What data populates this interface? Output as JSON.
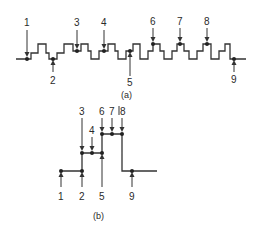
{
  "diagram_a": {
    "caption": "(a)",
    "points": [
      {
        "label": "1",
        "x": 27,
        "y": 59,
        "from": "top"
      },
      {
        "label": "2",
        "x": 53,
        "y": 59,
        "from": "bottom"
      },
      {
        "label": "3",
        "x": 77,
        "y": 51,
        "from": "top"
      },
      {
        "label": "4",
        "x": 104,
        "y": 51,
        "from": "top"
      },
      {
        "label": "5",
        "x": 130,
        "y": 51,
        "from": "bottom"
      },
      {
        "label": "6",
        "x": 153,
        "y": 44,
        "from": "top"
      },
      {
        "label": "7",
        "x": 180,
        "y": 44,
        "from": "top"
      },
      {
        "label": "8",
        "x": 207,
        "y": 44,
        "from": "top"
      },
      {
        "label": "9",
        "x": 234,
        "y": 59,
        "from": "bottom"
      }
    ]
  },
  "diagram_b": {
    "caption": "(b)",
    "points": [
      {
        "label": "1",
        "x": 61,
        "y": 171,
        "from": "bottom"
      },
      {
        "label": "2",
        "x": 82,
        "y": 171,
        "from": "bottom"
      },
      {
        "label": "3",
        "x": 82,
        "y": 153,
        "from": "top"
      },
      {
        "label": "4",
        "x": 92,
        "y": 153,
        "from": "top"
      },
      {
        "label": "5",
        "x": 102,
        "y": 153,
        "from": "bottom"
      },
      {
        "label": "6",
        "x": 102,
        "y": 134,
        "from": "top"
      },
      {
        "label": "7",
        "x": 112,
        "y": 134,
        "from": "top"
      },
      {
        "label": "8",
        "x": 122,
        "y": 134,
        "from": "top"
      },
      {
        "label": "9",
        "x": 132,
        "y": 171,
        "from": "bottom"
      }
    ]
  },
  "colors": {
    "line": "#333333",
    "background": "#ffffff"
  }
}
